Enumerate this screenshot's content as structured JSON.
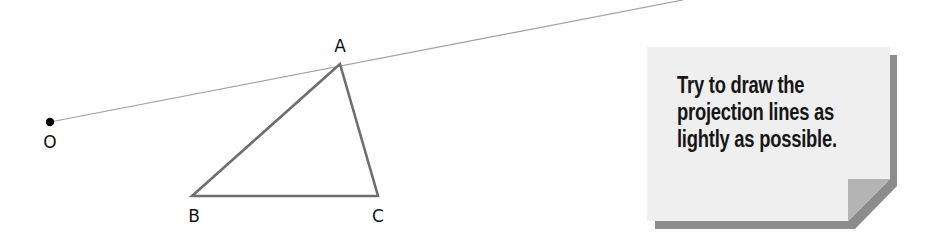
{
  "diagram": {
    "points": {
      "O": {
        "label": "O",
        "x": 50,
        "y": 122
      },
      "A": {
        "label": "A",
        "x": 340,
        "y": 64
      },
      "B": {
        "label": "B",
        "x": 192,
        "y": 196
      },
      "C": {
        "label": "C",
        "x": 378,
        "y": 196
      }
    },
    "projection_line": {
      "from": "O",
      "through": "A",
      "end": {
        "x": 683,
        "y": 0
      }
    },
    "triangle": [
      "A",
      "B",
      "C"
    ],
    "colors": {
      "triangle_stroke": "#6e6e6e",
      "projection_stroke": "#a0a0a0",
      "point_fill": "#000000",
      "note_fill": "#efefef",
      "note_shadow": "#8c8c8c",
      "note_fold": "#b4b4b4"
    }
  },
  "note": {
    "lines": [
      "Try to draw the",
      "projection lines as",
      "lightly as possible."
    ]
  }
}
